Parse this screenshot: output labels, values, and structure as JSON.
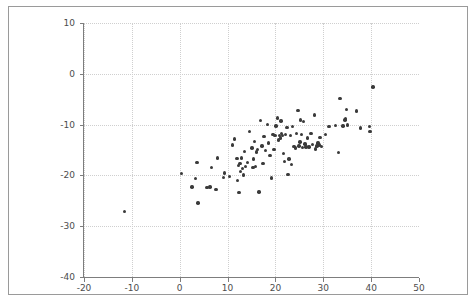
{
  "figure": {
    "background": "#ffffff",
    "frame_color": "#9a9a9a",
    "axis_color": "#7d7d7d",
    "grid_color": "#cfcfcf",
    "marker_color": "#3a3a3a"
  },
  "chart_data": {
    "type": "scatter",
    "title": "",
    "xlabel": "",
    "ylabel": "",
    "xlim": [
      -20,
      50
    ],
    "ylim": [
      -40,
      10
    ],
    "grid": true,
    "legend": null,
    "xticks": [
      -20,
      -10,
      0,
      10,
      20,
      30,
      40,
      50
    ],
    "xtick_labels": [
      "-20",
      "-10",
      "0",
      "10",
      "20",
      "30",
      "40",
      "50"
    ],
    "yticks": [
      10,
      0,
      -10,
      -20,
      -30,
      -40
    ],
    "ytick_labels": [
      "10",
      "0",
      "-10",
      "-20",
      "-30",
      "-40"
    ],
    "series": [
      {
        "name": "observations",
        "marker": "circle",
        "color": "#3a3a3a",
        "points": [
          [
            -11.5,
            -27.1
          ],
          [
            0.4,
            -19.6
          ],
          [
            2.6,
            -22.3
          ],
          [
            3.3,
            -20.6
          ],
          [
            3.6,
            -17.5
          ],
          [
            3.8,
            -25.4
          ],
          [
            5.7,
            -22.4
          ],
          [
            6.3,
            -22.3
          ],
          [
            6.7,
            -18.5
          ],
          [
            7.6,
            -22.8
          ],
          [
            7.9,
            -16.6
          ],
          [
            9.2,
            -20.4
          ],
          [
            9.4,
            -19.5
          ],
          [
            10.4,
            -20.2
          ],
          [
            11.0,
            -14.0
          ],
          [
            11.4,
            -12.8
          ],
          [
            12.0,
            -16.7
          ],
          [
            12.1,
            -21.0
          ],
          [
            12.3,
            -18.0
          ],
          [
            12.4,
            -23.4
          ],
          [
            12.6,
            -17.6
          ],
          [
            12.7,
            -19.2
          ],
          [
            12.9,
            -16.6
          ],
          [
            13.1,
            -18.6
          ],
          [
            13.3,
            -19.9
          ],
          [
            13.5,
            -15.3
          ],
          [
            13.8,
            -18.3
          ],
          [
            14.2,
            -17.4
          ],
          [
            14.6,
            -11.3
          ],
          [
            15.1,
            -14.6
          ],
          [
            15.3,
            -18.5
          ],
          [
            15.4,
            -16.8
          ],
          [
            15.6,
            -13.3
          ],
          [
            15.8,
            -18.2
          ],
          [
            16.1,
            -15.4
          ],
          [
            16.3,
            -14.9
          ],
          [
            16.6,
            -23.3
          ],
          [
            16.9,
            -9.2
          ],
          [
            17.2,
            -14.2
          ],
          [
            17.4,
            -17.7
          ],
          [
            17.6,
            -12.4
          ],
          [
            17.9,
            -15.1
          ],
          [
            18.3,
            -10.0
          ],
          [
            18.6,
            -13.6
          ],
          [
            18.9,
            -16.1
          ],
          [
            19.2,
            -20.5
          ],
          [
            19.5,
            -11.9
          ],
          [
            19.7,
            -14.9
          ],
          [
            19.9,
            -12.2
          ],
          [
            20.1,
            -10.3
          ],
          [
            20.4,
            -8.7
          ],
          [
            20.6,
            -13.0
          ],
          [
            20.8,
            -12.1
          ],
          [
            21.0,
            -12.6
          ],
          [
            21.2,
            -9.3
          ],
          [
            21.3,
            -11.7
          ],
          [
            21.5,
            -12.2
          ],
          [
            21.7,
            -15.7
          ],
          [
            21.9,
            -17.3
          ],
          [
            22.1,
            -11.9
          ],
          [
            22.4,
            -10.6
          ],
          [
            22.6,
            -19.8
          ],
          [
            22.8,
            -16.8
          ],
          [
            23.1,
            -12.1
          ],
          [
            23.4,
            -17.9
          ],
          [
            23.6,
            -10.4
          ],
          [
            23.9,
            -14.3
          ],
          [
            24.2,
            -14.6
          ],
          [
            24.4,
            -11.8
          ],
          [
            24.7,
            -7.2
          ],
          [
            24.9,
            -14.2
          ],
          [
            25.1,
            -13.4
          ],
          [
            25.3,
            -9.1
          ],
          [
            25.5,
            -12.0
          ],
          [
            25.7,
            -14.5
          ],
          [
            25.9,
            -9.4
          ],
          [
            26.2,
            -13.8
          ],
          [
            26.4,
            -14.4
          ],
          [
            26.7,
            -12.6
          ],
          [
            27.0,
            -14.4
          ],
          [
            27.4,
            -11.8
          ],
          [
            27.8,
            -13.9
          ],
          [
            28.1,
            -8.1
          ],
          [
            28.4,
            -14.8
          ],
          [
            28.7,
            -14.2
          ],
          [
            28.9,
            -13.6
          ],
          [
            29.1,
            -14.0
          ],
          [
            29.3,
            -12.5
          ],
          [
            29.6,
            -14.3
          ],
          [
            30.4,
            -11.9
          ],
          [
            31.2,
            -10.4
          ],
          [
            32.6,
            -10.2
          ],
          [
            33.2,
            -15.5
          ],
          [
            33.5,
            -4.9
          ],
          [
            34.1,
            -10.3
          ],
          [
            34.5,
            -9.1
          ],
          [
            34.6,
            -8.8
          ],
          [
            34.8,
            -7.0
          ],
          [
            35.0,
            -10.1
          ],
          [
            37.0,
            -7.3
          ],
          [
            37.8,
            -10.7
          ],
          [
            39.6,
            -10.4
          ],
          [
            39.8,
            -11.3
          ],
          [
            40.4,
            -2.6
          ]
        ]
      }
    ]
  }
}
